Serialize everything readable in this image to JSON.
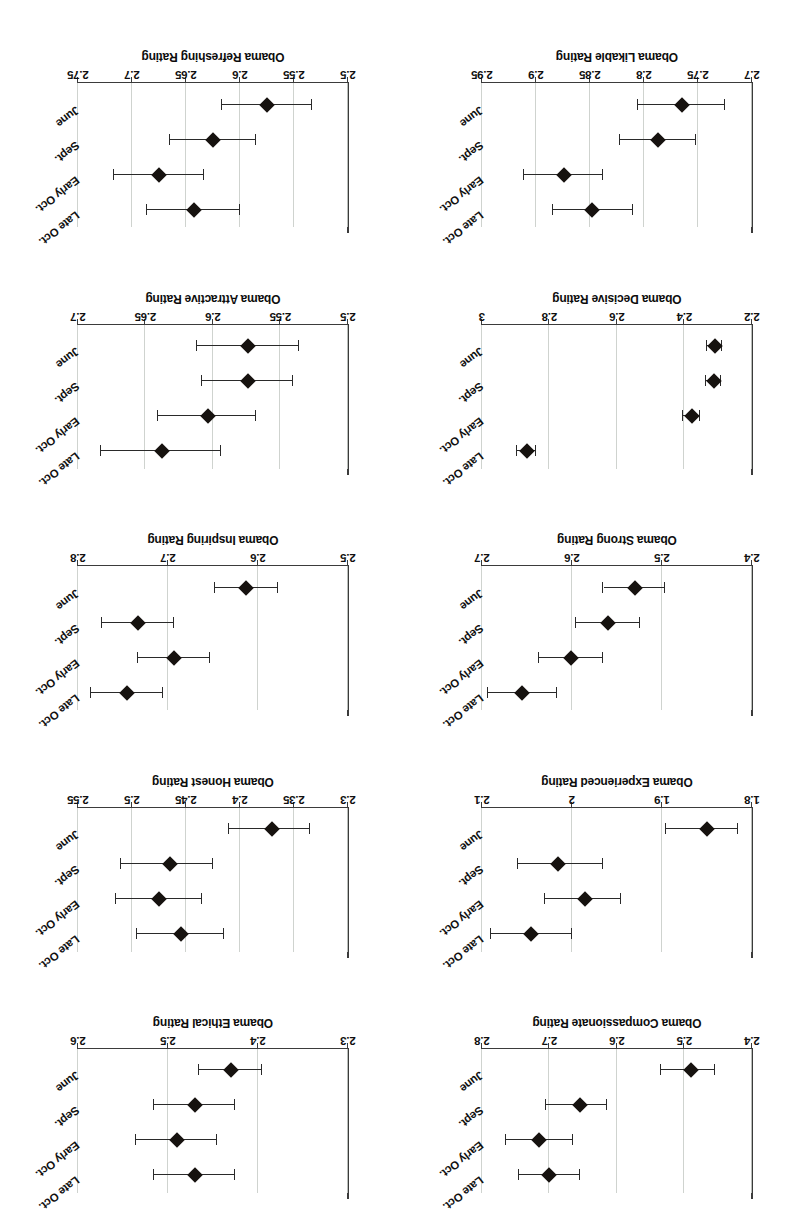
{
  "figure": {
    "layout": "2 columns x 5 rows of error-bar panels",
    "orientation_note": "page scanned upside down (rotated 180 degrees)",
    "categories": [
      "June",
      "Sept.",
      "Early Oct.",
      "Late Oct."
    ],
    "marker_shape": "diamond",
    "marker_color": "#16120f",
    "line_color": "#2a2a2a",
    "gridline_color": "#cfd3cf",
    "axis_color": "#3b3b3b",
    "background": "#ffffff"
  },
  "chart_data": [
    {
      "type": "scatter",
      "panel": "row1-left",
      "title": "",
      "ylabel": "Obama Compassionate Rating",
      "xlabel": "",
      "categories": [
        "June",
        "Sept.",
        "Early Oct.",
        "Late Oct."
      ],
      "values": [
        2.49,
        2.655,
        2.715,
        2.7
      ],
      "err_low": [
        2.455,
        2.615,
        2.665,
        2.655
      ],
      "err_high": [
        2.535,
        2.705,
        2.765,
        2.745
      ],
      "ylim": [
        2.4,
        2.8
      ],
      "yticks": [
        2.4,
        2.5,
        2.6,
        2.7,
        2.8
      ],
      "ytick_labels": [
        "2.4",
        "2.5",
        "2.6",
        "2.7",
        "2.8"
      ],
      "grid": true,
      "legend": "none"
    },
    {
      "type": "scatter",
      "panel": "row1-right",
      "title": "",
      "ylabel": "Obama Ethical Rating",
      "xlabel": "",
      "categories": [
        "June",
        "Sept.",
        "Early Oct.",
        "Late Oct."
      ],
      "values": [
        2.43,
        2.47,
        2.49,
        2.47
      ],
      "err_low": [
        2.395,
        2.425,
        2.445,
        2.425
      ],
      "err_high": [
        2.465,
        2.515,
        2.535,
        2.515
      ],
      "ylim": [
        2.3,
        2.6
      ],
      "yticks": [
        2.3,
        2.4,
        2.5,
        2.6
      ],
      "ytick_labels": [
        "2.3",
        "2.4",
        "2.5",
        "2.6"
      ],
      "grid": true,
      "legend": "none"
    },
    {
      "type": "scatter",
      "panel": "row2-left",
      "title": "",
      "ylabel": "Obama Experienced Rating",
      "xlabel": "",
      "categories": [
        "June",
        "Sept.",
        "Early Oct.",
        "Late Oct."
      ],
      "values": [
        1.85,
        2.015,
        1.985,
        2.045
      ],
      "err_low": [
        1.815,
        1.965,
        1.945,
        2.0
      ],
      "err_high": [
        1.895,
        2.06,
        2.03,
        2.09
      ],
      "ylim": [
        1.8,
        2.1
      ],
      "yticks": [
        1.8,
        1.9,
        2.0,
        2.1
      ],
      "ytick_labels": [
        "1.8",
        "1.9",
        "2",
        "2.1"
      ],
      "grid": true,
      "legend": "none"
    },
    {
      "type": "scatter",
      "panel": "row2-right",
      "title": "",
      "ylabel": "Obama Honest Rating",
      "xlabel": "",
      "categories": [
        "June",
        "Sept.",
        "Early Oct.",
        "Late Oct."
      ],
      "values": [
        2.37,
        2.465,
        2.475,
        2.455
      ],
      "err_low": [
        2.335,
        2.425,
        2.435,
        2.415
      ],
      "err_high": [
        2.41,
        2.51,
        2.515,
        2.495
      ],
      "ylim": [
        2.3,
        2.55
      ],
      "yticks": [
        2.3,
        2.35,
        2.4,
        2.45,
        2.5,
        2.55
      ],
      "ytick_labels": [
        "2.3",
        "2.35",
        "2.4",
        "2.45",
        "2.5",
        "2.55"
      ],
      "grid": true,
      "legend": "none"
    },
    {
      "type": "scatter",
      "panel": "row3-left",
      "title": "",
      "ylabel": "Obama Strong Rating",
      "xlabel": "",
      "categories": [
        "June",
        "Sept.",
        "Early Oct.",
        "Late Oct."
      ],
      "values": [
        2.53,
        2.56,
        2.601,
        2.655
      ],
      "err_low": [
        2.497,
        2.524,
        2.566,
        2.617
      ],
      "err_high": [
        2.565,
        2.596,
        2.637,
        2.693
      ],
      "ylim": [
        2.4,
        2.7
      ],
      "yticks": [
        2.4,
        2.5,
        2.6,
        2.7
      ],
      "ytick_labels": [
        "2.4",
        "2.5",
        "2.6",
        "2.7"
      ],
      "grid": true,
      "legend": "none"
    },
    {
      "type": "scatter",
      "panel": "row3-right",
      "title": "",
      "ylabel": "Obama Inspiring Rating",
      "xlabel": "",
      "categories": [
        "June",
        "Sept.",
        "Early Oct.",
        "Late Oct."
      ],
      "values": [
        2.613,
        2.733,
        2.693,
        2.745
      ],
      "err_low": [
        2.578,
        2.693,
        2.653,
        2.705
      ],
      "err_high": [
        2.648,
        2.773,
        2.733,
        2.785
      ],
      "ylim": [
        2.5,
        2.8
      ],
      "yticks": [
        2.5,
        2.6,
        2.7,
        2.8
      ],
      "ytick_labels": [
        "2.5",
        "2.6",
        "2.7",
        "2.8"
      ],
      "grid": true,
      "legend": "none"
    },
    {
      "type": "scatter",
      "panel": "row4-left",
      "title": "",
      "ylabel": "Obama Decisive Rating",
      "xlabel": "",
      "categories": [
        "June",
        "Sept.",
        "Early Oct.",
        "Late Oct."
      ],
      "values": [
        2.31,
        2.313,
        2.378,
        2.868
      ],
      "err_low": [
        2.288,
        2.292,
        2.353,
        2.84
      ],
      "err_high": [
        2.333,
        2.335,
        2.403,
        2.896
      ],
      "ylim": [
        2.2,
        3.0
      ],
      "yticks": [
        2.2,
        2.4,
        2.6,
        2.8,
        3.0
      ],
      "ytick_labels": [
        "2.2",
        "2.4",
        "2.6",
        "2.8",
        "3"
      ],
      "grid": true,
      "legend": "none"
    },
    {
      "type": "scatter",
      "panel": "row4-right",
      "title": "",
      "ylabel": "Obama Attractive Rating",
      "xlabel": "",
      "categories": [
        "June",
        "Sept.",
        "Early Oct.",
        "Late Oct."
      ],
      "values": [
        2.574,
        2.574,
        2.604,
        2.638
      ],
      "err_low": [
        2.536,
        2.541,
        2.568,
        2.594
      ],
      "err_high": [
        2.612,
        2.608,
        2.641,
        2.683
      ],
      "ylim": [
        2.5,
        2.7
      ],
      "yticks": [
        2.5,
        2.55,
        2.6,
        2.65,
        2.7
      ],
      "ytick_labels": [
        "2.5",
        "2.55",
        "2.6",
        "2.65",
        "2.7"
      ],
      "grid": true,
      "legend": "none"
    },
    {
      "type": "scatter",
      "panel": "row5-left",
      "title": "",
      "ylabel": "Obama Likable Rating",
      "xlabel": "",
      "categories": [
        "June",
        "Sept.",
        "Early Oct.",
        "Late Oct."
      ],
      "values": [
        2.765,
        2.787,
        2.874,
        2.848
      ],
      "err_low": [
        2.725,
        2.752,
        2.838,
        2.81
      ],
      "err_high": [
        2.806,
        2.822,
        2.911,
        2.884
      ],
      "ylim": [
        2.7,
        2.95
      ],
      "yticks": [
        2.7,
        2.75,
        2.8,
        2.85,
        2.9,
        2.95
      ],
      "ytick_labels": [
        "2.7",
        "2.75",
        "2.8",
        "2.85",
        "2.9",
        "2.95"
      ],
      "grid": true,
      "legend": "none"
    },
    {
      "type": "scatter",
      "panel": "row5-right",
      "title": "",
      "ylabel": "Obama Refreshing Rating",
      "xlabel": "",
      "categories": [
        "June",
        "Sept.",
        "Early Oct.",
        "Late Oct."
      ],
      "values": [
        2.575,
        2.625,
        2.675,
        2.643
      ],
      "err_low": [
        2.533,
        2.585,
        2.633,
        2.6
      ],
      "err_high": [
        2.617,
        2.665,
        2.717,
        2.686
      ],
      "ylim": [
        2.5,
        2.75
      ],
      "yticks": [
        2.5,
        2.55,
        2.6,
        2.65,
        2.7,
        2.75
      ],
      "ytick_labels": [
        "2.5",
        "2.55",
        "2.6",
        "2.65",
        "2.7",
        "2.75"
      ],
      "grid": true,
      "legend": "none"
    }
  ]
}
